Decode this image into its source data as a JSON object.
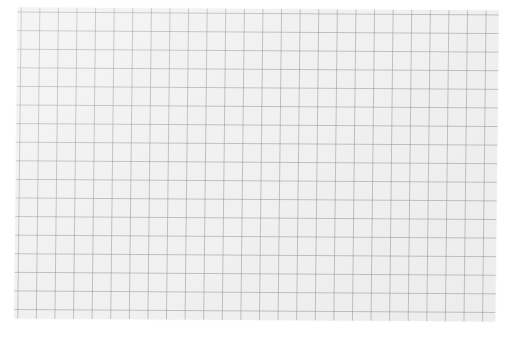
{
  "image": {
    "subject": "grid paper sheet",
    "colors": {
      "background": "#ffffff",
      "paper": "#f1f1f1",
      "grid_line": "#c4c4c4"
    },
    "grid": {
      "cell_size_px": 18.6,
      "columns": 26,
      "rows": 17
    }
  }
}
